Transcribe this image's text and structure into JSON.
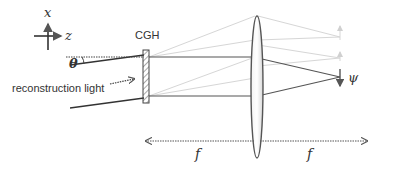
{
  "diagram": {
    "type": "optical-setup",
    "axes": {
      "x_label": "x",
      "z_label": "z"
    },
    "components": {
      "hologram_label": "CGH",
      "light_label": "reconstruction light",
      "angle_label": "θ",
      "output_label": "ψ",
      "focal_left_label": "f",
      "focal_right_label": "f"
    },
    "colors": {
      "main_rays": "#555555",
      "faint_rays": "#d6d6d6",
      "lens_fill": "#e8e8e8",
      "lens_stroke": "#555555",
      "text": "#333333"
    }
  }
}
